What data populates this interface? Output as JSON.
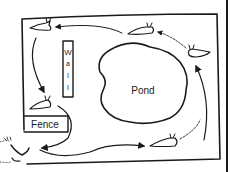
{
  "diagram": {
    "title": "",
    "labels": {
      "pond": "Pond",
      "fence": "Fence",
      "wall_letters": [
        "W",
        "a",
        "l",
        "l"
      ]
    },
    "elements": [
      {
        "type": "enclosure",
        "description": "hand-drawn rectangular garden boundary, open at lower-left below fence"
      },
      {
        "type": "pond",
        "label": "Pond"
      },
      {
        "type": "wall",
        "label": "Wall",
        "orientation": "vertical"
      },
      {
        "type": "fence",
        "label": "Fence"
      },
      {
        "type": "slug",
        "count": 5
      },
      {
        "type": "foot",
        "position": "outside lower-left gap"
      }
    ],
    "flow": "slugs travel in a loop around the pond: bottom-right -> right side -> top -> left side -> past fence -> out through gap toward foot, then back along bottom",
    "colors": {
      "ink": "#1a1a1a",
      "background": "#ffffff"
    }
  }
}
